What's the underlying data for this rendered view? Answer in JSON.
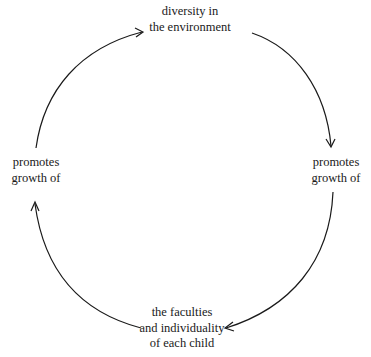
{
  "diagram": {
    "type": "cycle",
    "nodes": [
      {
        "id": "top",
        "lines": [
          "diversity in",
          "the environment"
        ]
      },
      {
        "id": "right",
        "lines": [
          "promotes",
          "growth of"
        ]
      },
      {
        "id": "bottom",
        "lines": [
          "the faculties",
          "and individuality",
          "of each child"
        ]
      },
      {
        "id": "left",
        "lines": [
          "promotes",
          "growth of"
        ]
      }
    ],
    "edges": [
      {
        "from": "top",
        "to": "right",
        "direction": "clockwise"
      },
      {
        "from": "right",
        "to": "bottom",
        "direction": "clockwise"
      },
      {
        "from": "bottom",
        "to": "left",
        "direction": "clockwise"
      },
      {
        "from": "left",
        "to": "top",
        "direction": "clockwise"
      }
    ],
    "colors": {
      "stroke": "#1a1a1a",
      "background": "#ffffff"
    }
  }
}
